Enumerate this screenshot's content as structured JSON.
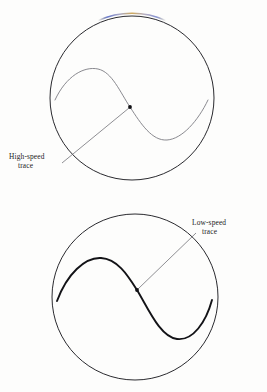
{
  "page": {
    "background_color": "#fdfdfc",
    "width": 267,
    "height": 392
  },
  "figures": [
    {
      "id": "high-speed-figure",
      "label_line_1": "High-speed",
      "label_line_2": "trace",
      "circle": {
        "cx": 132,
        "cy": 98,
        "r": 82,
        "stroke": "#2a2a2f",
        "stroke_width": 1.0
      },
      "trace": {
        "name": "high-speed-trace",
        "stroke": "#7c7c82",
        "stroke_width": 0.9,
        "amplitude": 38,
        "description": "shallow sinusoidal S-curve"
      },
      "marker_dot": {
        "cx": 130,
        "cy": 107,
        "r": 1.9,
        "color": "#101014"
      },
      "leader_line": {
        "x1": 130,
        "y1": 107,
        "x2": 62,
        "y2": 163,
        "stroke": "#6a6a70"
      },
      "chromatic_fringe": {
        "present": true,
        "colors": [
          "#3f57c8",
          "#c08a2a"
        ],
        "location": "top-arc"
      }
    },
    {
      "id": "low-speed-figure",
      "label_line_1": "Low-speed",
      "label_line_2": "trace",
      "circle": {
        "cx": 135,
        "cy": 297,
        "r": 83,
        "stroke": "#2a2a2f",
        "stroke_width": 1.0
      },
      "trace": {
        "name": "low-speed-trace",
        "stroke": "#131317",
        "stroke_width": 1.9,
        "amplitude": 43,
        "description": "deep sinusoidal S-curve"
      },
      "marker_dot": {
        "cx": 137,
        "cy": 290,
        "r": 1.9,
        "color": "#101014"
      },
      "leader_line": {
        "x1": 137,
        "y1": 290,
        "x2": 196,
        "y2": 233,
        "stroke": "#6a6a70"
      },
      "chromatic_fringe": {
        "present": false,
        "colors": [],
        "location": ""
      }
    }
  ]
}
